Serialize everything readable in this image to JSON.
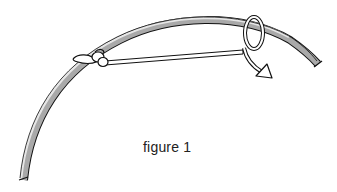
{
  "figure": {
    "caption": "figure 1",
    "elements": [
      "curved-bow-stave",
      "string",
      "knot-at-left",
      "loop-at-right",
      "direction-arrow"
    ],
    "colors": {
      "outline": "#111111",
      "stave_light": "#e6e6e6",
      "stave_dark": "#a9a9a9",
      "string_fill": "#ffffff",
      "background": "#ffffff"
    }
  }
}
